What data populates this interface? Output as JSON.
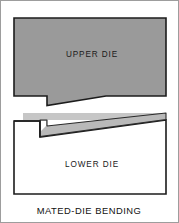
{
  "figure": {
    "caption": "MATED-DIE BENDING",
    "background_color": "#ffffff",
    "frame_color": "#9d9d9d",
    "width_px": 179,
    "height_px": 223
  },
  "upper_die": {
    "label": "UPPER DIE",
    "fill_color": "#9a9a9a",
    "outline_color": "#1c1c1c",
    "label_x": 92,
    "label_y": 57
  },
  "workpiece": {
    "label": "",
    "flat_fill_color": "#c6c6c6",
    "bent_fill_color": "#b9b9b9",
    "outline_color": "#2a2a2a"
  },
  "lower_die": {
    "label": "LOWER DIE",
    "fill_color": "#ffffff",
    "outline_color": "#1c1c1c",
    "label_x": 92,
    "label_y": 167
  },
  "geometry": {
    "upper_die_path": "M 14,18 L 166,18 L 166,96 L 106,96 L 47,105.5 L 47,96 L 14,96 Z",
    "lower_die_path": "M 14,121 L 40,121 L 40,137 L 166,120 L 166,194 L 14,194 Z",
    "workpiece_flat_path": "M 23,113 L 160,113 L 160,120 L 23,120 Z",
    "workpiece_bent_path": "M 40,120 L 40,136.5 L 166,119.5 L 166,113 L 47,126 L 47,120 Z",
    "notch_highlight_path": "M 41,121 L 46,121 L 46,126 L 41,131 Z"
  }
}
